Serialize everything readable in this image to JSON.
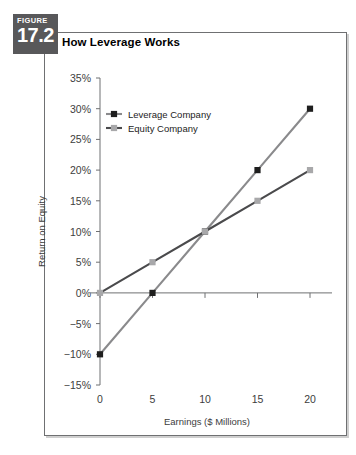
{
  "figure": {
    "badge_word": "FIGURE",
    "badge_number": "17.2",
    "title": "How Leverage Works"
  },
  "chart_data": {
    "type": "line",
    "title": "How Leverage Works",
    "xlabel": "Earnings ($ Millions)",
    "ylabel": "Return on Equity",
    "x": [
      0,
      5,
      10,
      15,
      20
    ],
    "xtick_labels": [
      "0",
      "5",
      "10",
      "15",
      "20"
    ],
    "xlim": [
      0,
      20
    ],
    "ylim": [
      -15,
      35
    ],
    "ytick_values": [
      35,
      30,
      25,
      20,
      15,
      10,
      5,
      0,
      -5,
      -10,
      -15
    ],
    "ytick_labels": [
      "35%",
      "30%",
      "25%",
      "20%",
      "15%",
      "10%",
      "5%",
      "0%",
      "−5%",
      "−10%",
      "−15%"
    ],
    "grid": false,
    "legend_position": "top-left",
    "series": [
      {
        "name": "Leverage Company",
        "values": [
          -10,
          0,
          10,
          20,
          30
        ],
        "line_color": "#8a8a8c",
        "marker_color": "#1e1e1e"
      },
      {
        "name": "Equity Company",
        "values": [
          0,
          5,
          10,
          15,
          20
        ],
        "line_color": "#4a4a4c",
        "marker_color": "#a8a8aa"
      }
    ]
  },
  "legend": {
    "items": [
      {
        "label": "Leverage Company"
      },
      {
        "label": "Equity Company"
      }
    ]
  },
  "axes": {
    "y_title": "Return on Equity",
    "x_title": "Earnings ($ Millions)"
  }
}
